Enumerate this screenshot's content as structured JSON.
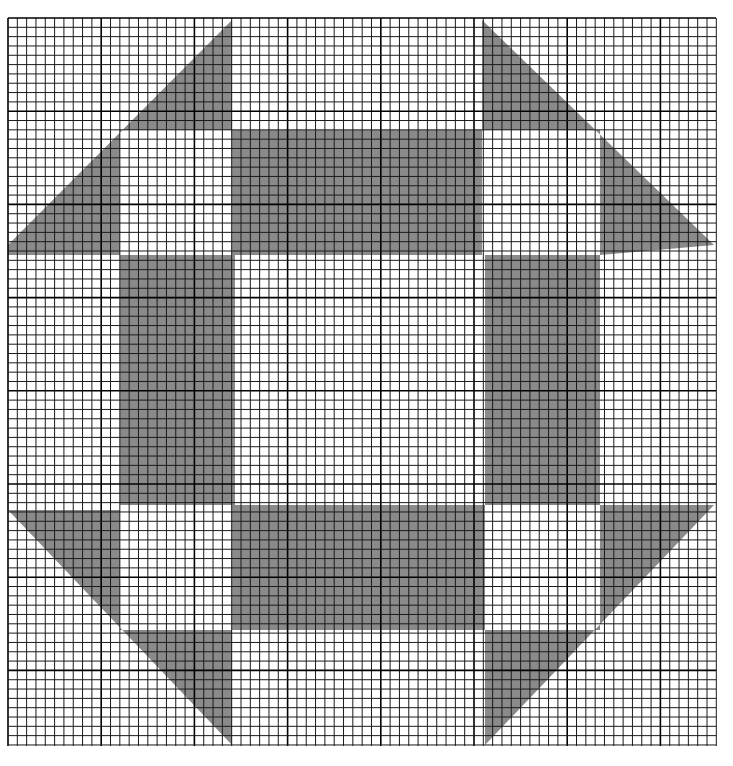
{
  "grid": {
    "x0": 8,
    "y0": 18,
    "x1": 716,
    "y1": 746,
    "cell": 9.32,
    "major_every": 10,
    "line_color": "#1a1a1a",
    "major_line_color": "#000000",
    "paper_color": "#ffffff"
  },
  "pattern": {
    "fill_color": "#8a8a8a",
    "shapes": [
      {
        "name": "top-left-arrow",
        "points": "232,20 232,130 232,130 120,130 120,255 8,255 8,245"
      },
      {
        "name": "top-right-arrow",
        "points": "482,20 482,130 600,130 600,255 714,245"
      },
      {
        "name": "bottom-left-arrow",
        "points": "8,510 120,510 120,630 232,630 232,745"
      },
      {
        "name": "bottom-right-arrow",
        "points": "714,505 600,505 600,630 485,630 485,745"
      },
      {
        "name": "frame-top",
        "points": "232,130 482,130 482,255 232,255"
      },
      {
        "name": "frame-bottom",
        "points": "232,505 485,505 485,630 232,630"
      },
      {
        "name": "frame-left",
        "points": "120,255 235,255 235,505 120,505"
      },
      {
        "name": "frame-right",
        "points": "485,255 600,255 600,505 485,505"
      }
    ]
  }
}
